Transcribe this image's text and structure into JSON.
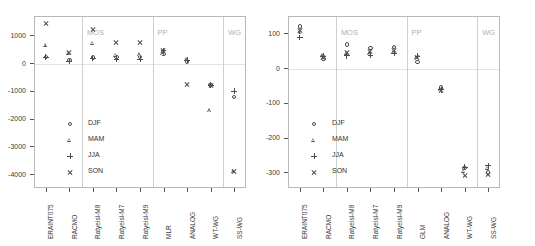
{
  "figure": {
    "panels": [
      {
        "id": "left",
        "ylim": [
          -4500,
          1700
        ],
        "yticks": [
          1000,
          0,
          -1000,
          -2000,
          -3000,
          -4000
        ],
        "ytick_labels": [
          "1000",
          "0",
          "-1000",
          "-2000",
          "-3000",
          "-4000"
        ],
        "categories": [
          "ERAINT075",
          "RACMO",
          "Ratyeisl-M8",
          "Ratyeisl-M7",
          "Ratyeisl-M9",
          "MLR",
          "ANALOG",
          "WT-WG",
          "SS-WG"
        ],
        "group_headers": [
          {
            "label": "MOS",
            "at": 2
          },
          {
            "label": "PP",
            "at": 5
          },
          {
            "label": "WG",
            "at": 8
          }
        ],
        "separators": [
          1.5,
          4.5,
          7.5
        ],
        "series": [
          {
            "name": "DJF",
            "symbol": "circle",
            "values": [
              230,
              110,
              200,
              230,
              230,
              330,
              60,
              -790,
              -1230
            ]
          },
          {
            "name": "MAM",
            "symbol": "tri",
            "values": [
              660,
              360,
              720,
              300,
              310,
              350,
              140,
              -1700,
              -3900
            ]
          },
          {
            "name": "JJA",
            "symbol": "plus",
            "values": [
              210,
              80,
              170,
              150,
              150,
              450,
              100,
              -790,
              -1010
            ]
          },
          {
            "name": "SON",
            "symbol": "cross",
            "values": [
              1440,
              380,
              1200,
              760,
              740,
              470,
              -760,
              -790,
              -3900
            ]
          }
        ]
      },
      {
        "id": "right",
        "ylim": [
          -345,
          150
        ],
        "yticks": [
          100,
          0,
          -100,
          -200,
          -300
        ],
        "ytick_labels": [
          "100",
          "0",
          "-100",
          "-200",
          "-300"
        ],
        "categories": [
          "ERAINT075",
          "RACMO",
          "Ratyeisl-M8",
          "Ratyeisl-M7",
          "Ratyeisl-M9",
          "GLM",
          "ANALOG",
          "WT-WG",
          "SS-WG"
        ],
        "group_headers": [
          {
            "label": "MOS",
            "at": 2
          },
          {
            "label": "PP",
            "at": 5
          },
          {
            "label": "WG",
            "at": 8
          }
        ],
        "separators": [
          1.5,
          4.5,
          7.5
        ],
        "series": [
          {
            "name": "DJF",
            "symbol": "circle",
            "values": [
              120,
              26,
              68,
              58,
              60,
              18,
              -56,
              -287,
              -300
            ]
          },
          {
            "name": "MAM",
            "symbol": "tri",
            "values": [
              103,
              36,
              44,
              42,
              46,
              30,
              -62,
              -296,
              -288
            ]
          },
          {
            "name": "JJA",
            "symbol": "plus",
            "values": [
              88,
              34,
              36,
              38,
              42,
              34,
              -62,
              -285,
              -281
            ]
          },
          {
            "name": "SON",
            "symbol": "cross",
            "values": [
              108,
              32,
              46,
              48,
              50,
              32,
              -64,
              -308,
              -306
            ]
          }
        ]
      }
    ],
    "legend": {
      "entries": [
        {
          "label": "DJF",
          "symbol": "circle"
        },
        {
          "label": "MAM",
          "symbol": "tri"
        },
        {
          "label": "JJA",
          "symbol": "plus"
        },
        {
          "label": "SON",
          "symbol": "cross"
        }
      ]
    }
  },
  "chart_data": {
    "type": "scatter",
    "title": "",
    "xlabel": "",
    "ylabel": "",
    "grid": false,
    "legend_position": "lower-left / lower-center",
    "panels": [
      {
        "panel": "left",
        "ylim": [
          -4500,
          1700
        ],
        "yticks": [
          1000,
          0,
          -1000,
          -2000,
          -3000,
          -4000
        ],
        "categories": [
          "ERAINT075",
          "RACMO",
          "Ratyeisl-M8",
          "Ratyeisl-M7",
          "Ratyeisl-M9",
          "MLR",
          "ANALOG",
          "WT-WG",
          "SS-WG"
        ],
        "group_headers": [
          "MOS",
          "PP",
          "WG"
        ],
        "series": [
          {
            "name": "DJF",
            "values": [
              230,
              110,
              200,
              230,
              230,
              330,
              60,
              -790,
              -1230
            ]
          },
          {
            "name": "MAM",
            "values": [
              660,
              360,
              720,
              300,
              310,
              350,
              140,
              -1700,
              -3900
            ]
          },
          {
            "name": "JJA",
            "values": [
              210,
              80,
              170,
              150,
              150,
              450,
              100,
              -790,
              -1010
            ]
          },
          {
            "name": "SON",
            "values": [
              1440,
              380,
              1200,
              760,
              740,
              470,
              -760,
              -790,
              -3900
            ]
          }
        ]
      },
      {
        "panel": "right",
        "ylim": [
          -345,
          150
        ],
        "yticks": [
          100,
          0,
          -100,
          -200,
          -300
        ],
        "categories": [
          "ERAINT075",
          "RACMO",
          "Ratyeisl-M8",
          "Ratyeisl-M7",
          "Ratyeisl-M9",
          "GLM",
          "ANALOG",
          "WT-WG",
          "SS-WG"
        ],
        "group_headers": [
          "MOS",
          "PP",
          "WG"
        ],
        "series": [
          {
            "name": "DJF",
            "values": [
              120,
              26,
              68,
              58,
              60,
              18,
              -56,
              -287,
              -300
            ]
          },
          {
            "name": "MAM",
            "values": [
              103,
              36,
              44,
              42,
              46,
              30,
              -62,
              -296,
              -288
            ]
          },
          {
            "name": "JJA",
            "values": [
              88,
              34,
              36,
              38,
              42,
              34,
              -62,
              -285,
              -281
            ]
          },
          {
            "name": "SON",
            "values": [
              108,
              32,
              46,
              48,
              50,
              32,
              -64,
              -308,
              -306
            ]
          }
        ]
      }
    ],
    "legend": [
      "DJF",
      "MAM",
      "JJA",
      "SON"
    ]
  }
}
